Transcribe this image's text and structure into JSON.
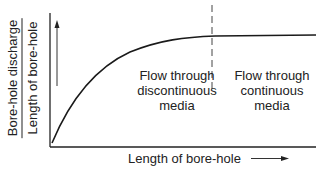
{
  "diagram": {
    "y_axis_label": {
      "numerator": "Bore-hole discharge",
      "denominator": "Length of bore-hole"
    },
    "x_axis_label": "Length of bore-hole",
    "regions": [
      {
        "label_lines": [
          "Flow through",
          "discontinuous",
          "media"
        ]
      },
      {
        "label_lines": [
          "Flow through",
          "continuous",
          "media"
        ]
      }
    ],
    "annotations": {
      "y_direction_arrow": "up-arrow",
      "x_direction_arrow": "right-arrow",
      "region_divider": "dashed-vertical-line"
    },
    "curve": "saturating-rise"
  }
}
